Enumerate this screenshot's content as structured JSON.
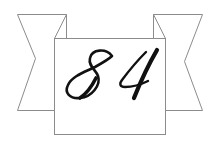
{
  "emblem": {
    "number_text": "84",
    "colors": {
      "background": "#ffffff",
      "outline": "#8c8c8c",
      "ink": "#111111"
    },
    "icon": "ribbon-banner-icon"
  }
}
